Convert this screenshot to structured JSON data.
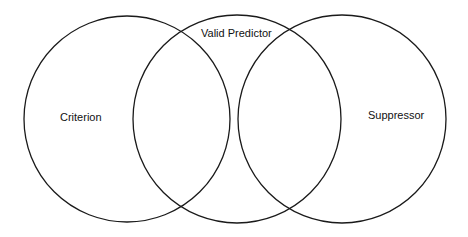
{
  "diagram": {
    "type": "venn",
    "sets": [
      {
        "id": "criterion",
        "label": "Criterion"
      },
      {
        "id": "valid-predictor",
        "label": "Valid Predictor"
      },
      {
        "id": "suppressor",
        "label": "Suppressor"
      }
    ],
    "overlaps": [
      {
        "sets": [
          "criterion",
          "valid-predictor"
        ]
      },
      {
        "sets": [
          "valid-predictor",
          "suppressor"
        ]
      }
    ],
    "colors": {
      "stroke": "#1a1a1a",
      "background": "#ffffff",
      "text": "#111111"
    }
  }
}
